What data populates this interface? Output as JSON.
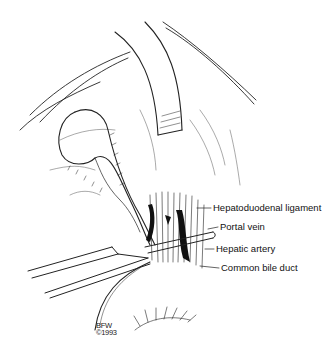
{
  "figure": {
    "labels": [
      {
        "id": "hepatoduodenal-ligament",
        "text": "Hepatoduodenal ligament",
        "x": 213,
        "y": 203
      },
      {
        "id": "portal-vein",
        "text": "Portal vein",
        "x": 220,
        "y": 222
      },
      {
        "id": "hepatic-artery",
        "text": "Hepatic artery",
        "x": 216,
        "y": 244
      },
      {
        "id": "common-bile-duct",
        "text": "Common bile duct",
        "x": 221,
        "y": 263
      }
    ],
    "signature": {
      "line1": "BFW",
      "line2": "©1993"
    },
    "colors": {
      "ink": "#111111",
      "background": "#ffffff"
    }
  }
}
